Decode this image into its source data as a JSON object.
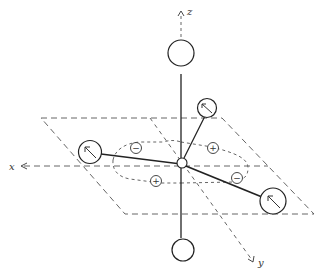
{
  "diagram": {
    "type": "molecular-geometry-orbital",
    "axes": {
      "x_label": "x",
      "y_label": "y",
      "z_label": "z"
    },
    "colors": {
      "line": "#333333",
      "dashed": "#555555",
      "background": "#ffffff"
    },
    "ligands": [
      {
        "id": "axial-top",
        "position": "+z",
        "has_arrow": false
      },
      {
        "id": "axial-bottom",
        "position": "-z",
        "has_arrow": false
      },
      {
        "id": "equatorial-left",
        "position": "+x",
        "has_arrow": true
      },
      {
        "id": "equatorial-back",
        "position": "back-right",
        "has_arrow": true
      },
      {
        "id": "equatorial-front-right",
        "position": "front-right",
        "has_arrow": true
      }
    ],
    "orbital_lobes": [
      {
        "id": "lobe-upper-left",
        "sign": "−"
      },
      {
        "id": "lobe-upper-right",
        "sign": "+"
      },
      {
        "id": "lobe-lower-left",
        "sign": "+"
      },
      {
        "id": "lobe-lower-right",
        "sign": "−"
      }
    ]
  }
}
